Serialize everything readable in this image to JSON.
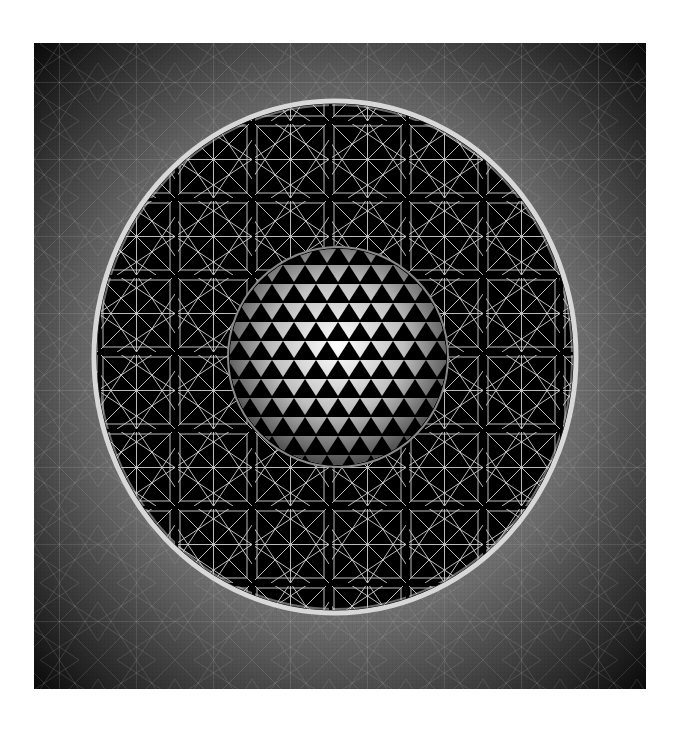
{
  "artwork": {
    "title": "Geometric sphere within circular star lattice",
    "canvas": {
      "width": 682,
      "height": 742,
      "background": "#ffffff"
    },
    "square": {
      "x": 34,
      "y": 43,
      "width": 612,
      "height": 646,
      "center_color": "#8a8a8a",
      "edge_color": "#0a0a0a"
    },
    "ring": {
      "cx": 335,
      "cy": 357,
      "rx": 241,
      "ry": 256,
      "stroke": "#d8d8d8",
      "inner_fill": "#000000"
    },
    "lattice": {
      "cell_size": 77,
      "line_color": "#c8c8c8",
      "separator_color": "#000000"
    },
    "sphere": {
      "cx": 338,
      "cy": 357,
      "r": 110,
      "highlight": "#ffffff",
      "shadow": "#3a3a3a",
      "triangle_size": 22
    }
  }
}
